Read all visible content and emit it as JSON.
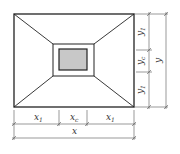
{
  "diagram": {
    "type": "plan view of foundation / slab with central column and opening",
    "colors": {
      "stroke": "#222222",
      "dim_stroke": "#555555",
      "column_fill": "#c8c8c8",
      "background": "#ffffff"
    },
    "labels": {
      "x_total": "x",
      "x_side_left": "x",
      "x_side_left_sub": "1",
      "x_center": "x",
      "x_center_sub": "c",
      "x_side_right": "x",
      "x_side_right_sub": "1",
      "y_total": "y",
      "y_side_top": "y",
      "y_side_top_sub": "1",
      "y_center": "y",
      "y_center_sub": "c",
      "y_side_bottom": "y",
      "y_side_bottom_sub": "1"
    }
  }
}
